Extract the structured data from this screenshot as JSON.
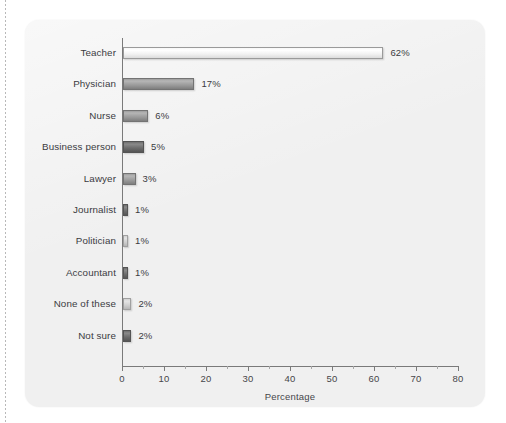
{
  "chart_data": {
    "type": "bar",
    "orientation": "horizontal",
    "title": "",
    "subtitle": "",
    "xlabel": "Percentage",
    "ylabel": "",
    "xlim": [
      0,
      80
    ],
    "xticks": [
      0,
      10,
      20,
      30,
      40,
      50,
      60,
      70,
      80
    ],
    "xtick_labels": [
      "0",
      "10",
      "20",
      "30",
      "40",
      "50",
      "60",
      "70",
      "80"
    ],
    "minor_ticks": true,
    "grid": false,
    "legend": null,
    "value_label_suffix": "%",
    "categories": [
      "Teacher",
      "Physician",
      "Nurse",
      "Business person",
      "Lawyer",
      "Journalist",
      "Politician",
      "Accountant",
      "None of these",
      "Not sure"
    ],
    "values": [
      62,
      17,
      6,
      5,
      3,
      1,
      1,
      1,
      2,
      2
    ],
    "data_labels": [
      "62%",
      "17%",
      "6%",
      "5%",
      "3%",
      "1%",
      "1%",
      "1%",
      "2%",
      "2%"
    ],
    "bar_tones": [
      "tone-light",
      "tone-mid",
      "tone-mid",
      "tone-dark",
      "tone-mid",
      "tone-dark",
      "tone-palegray",
      "tone-dark",
      "tone-palegray",
      "tone-dark"
    ]
  },
  "colors": {
    "panel_background": "#f0f0f0",
    "page_background": "#ffffff",
    "axis": "#7a7a7a",
    "text": "#3b3b3f",
    "bar_light": "#f2f2f2",
    "bar_mid": "#9a9a9a",
    "bar_dark": "#6b6b6b",
    "bar_pale": "#cfcfcf"
  }
}
